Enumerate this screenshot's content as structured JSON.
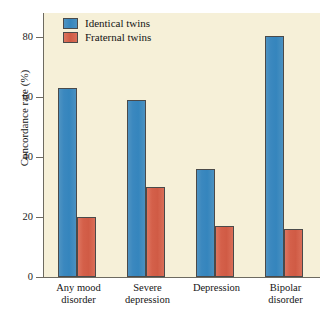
{
  "chart_data": {
    "type": "bar",
    "title": "",
    "xlabel": "",
    "ylabel": "Concordance rate (%)",
    "ylim": [
      0,
      88
    ],
    "yticks": [
      0,
      20,
      40,
      60,
      80
    ],
    "ytick_labels": [
      "0",
      "20",
      "40",
      "60",
      "80"
    ],
    "grid": false,
    "legend_position": "top-left",
    "categories": [
      "Any mood disorder",
      "Severe depression",
      "Depression",
      "Bipolar disorder"
    ],
    "category_lines": [
      [
        "Any mood",
        "disorder"
      ],
      [
        "Severe",
        "depression"
      ],
      [
        "Depression",
        ""
      ],
      [
        "Bipolar",
        "disorder"
      ]
    ],
    "series": [
      {
        "name": "Identical twins",
        "color": "#3585bd",
        "values": [
          63,
          59,
          36,
          80.5
        ]
      },
      {
        "name": "Fraternal twins",
        "color": "#d05b45",
        "values": [
          20,
          30,
          17,
          16
        ]
      }
    ]
  },
  "style": {
    "panel_background": "#f6f0d8",
    "axis_color": "#6d6a60",
    "text_color": "#141414"
  }
}
